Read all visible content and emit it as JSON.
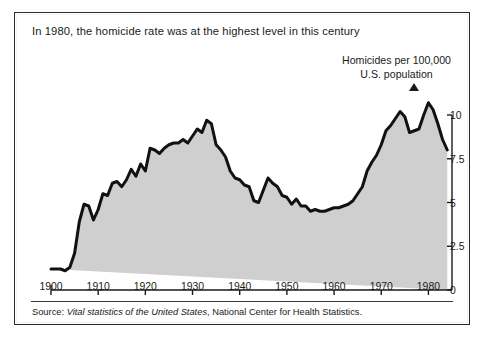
{
  "figure": {
    "title": "In 1980, the homicide rate was at the highest level in this century",
    "axis_label_line1": "Homicides per 100,000",
    "axis_label_line2": "U.S. population",
    "arrow_icon": "up-triangle-icon",
    "source_prefix": "Source:",
    "source_italic": "Vital statistics of the United States",
    "source_rest": ", National Center for Health Statistics.",
    "frame_color": "#2b2b2b",
    "line_color": "#111111",
    "fill_color": "#cfcfcf"
  },
  "chart_data": {
    "type": "area",
    "title": "In 1980, the homicide rate was at the highest level in this century",
    "xlabel": "",
    "ylabel": "Homicides per 100,000 U.S. population",
    "xlim": [
      1900,
      1985
    ],
    "ylim": [
      0,
      10.8
    ],
    "grid": false,
    "legend": "none",
    "xticks": [
      1900,
      1910,
      1920,
      1930,
      1940,
      1950,
      1960,
      1970,
      1980
    ],
    "xticklabels": [
      "1900",
      "1910",
      "1920",
      "1930",
      "1940",
      "1950",
      "1960",
      "1970",
      "1980"
    ],
    "yticks": [
      0,
      2.5,
      5,
      7.5,
      10
    ],
    "yticklabels": [
      "0",
      "2.5",
      "5",
      "7.5",
      "10"
    ],
    "yaxis_position": "right",
    "annotation": "Homicides per 100,000 U.S. population",
    "series": [
      {
        "name": "Homicide rate per 100,000 U.S. population",
        "x": [
          1900,
          1901,
          1902,
          1903,
          1904,
          1905,
          1906,
          1907,
          1908,
          1909,
          1910,
          1911,
          1912,
          1913,
          1914,
          1915,
          1916,
          1917,
          1918,
          1919,
          1920,
          1921,
          1922,
          1923,
          1924,
          1925,
          1926,
          1927,
          1928,
          1929,
          1930,
          1931,
          1932,
          1933,
          1934,
          1935,
          1936,
          1937,
          1938,
          1939,
          1940,
          1941,
          1942,
          1943,
          1944,
          1945,
          1946,
          1947,
          1948,
          1949,
          1950,
          1951,
          1952,
          1953,
          1954,
          1955,
          1956,
          1957,
          1958,
          1959,
          1960,
          1961,
          1962,
          1963,
          1964,
          1965,
          1966,
          1967,
          1968,
          1969,
          1970,
          1971,
          1972,
          1973,
          1974,
          1975,
          1976,
          1977,
          1978,
          1979,
          1980,
          1981,
          1982,
          1983,
          1984
        ],
        "values": [
          1.2,
          1.2,
          1.2,
          1.1,
          1.3,
          2.1,
          3.9,
          4.9,
          4.8,
          4.0,
          4.6,
          5.5,
          5.4,
          6.1,
          6.2,
          5.9,
          6.3,
          6.9,
          6.5,
          7.2,
          6.8,
          8.1,
          8.0,
          7.8,
          8.1,
          8.3,
          8.4,
          8.4,
          8.6,
          8.4,
          8.8,
          9.2,
          9.0,
          9.7,
          9.5,
          8.3,
          8.0,
          7.6,
          6.8,
          6.4,
          6.3,
          6.0,
          5.9,
          5.1,
          5.0,
          5.7,
          6.4,
          6.1,
          5.9,
          5.4,
          5.3,
          4.9,
          5.2,
          4.8,
          4.8,
          4.5,
          4.6,
          4.5,
          4.5,
          4.6,
          4.7,
          4.7,
          4.8,
          4.9,
          5.1,
          5.5,
          5.9,
          6.8,
          7.3,
          7.7,
          8.3,
          9.1,
          9.4,
          9.8,
          10.2,
          9.9,
          9.0,
          9.1,
          9.2,
          10.0,
          10.7,
          10.3,
          9.5,
          8.6,
          8.0
        ]
      }
    ]
  }
}
